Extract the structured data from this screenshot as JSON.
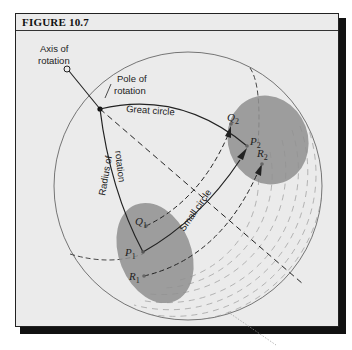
{
  "figure": {
    "title": "FIGURE 10.7",
    "colors": {
      "background": "#ebebeb",
      "frame": "#222222",
      "patch_fill": "#8f8f8f",
      "line": "#333333"
    }
  },
  "labels": {
    "axis_line1": "Axis of",
    "axis_line2": "rotation",
    "pole_line1": "Pole of",
    "pole_line2": "rotation",
    "great_circle": "Great circle",
    "radius_line1": "Radius of",
    "radius_line2": "rotation",
    "small_circle": "Small circle"
  },
  "points": {
    "P1": {
      "letter": "P",
      "sub": "1"
    },
    "Q1": {
      "letter": "Q",
      "sub": "1"
    },
    "R1": {
      "letter": "R",
      "sub": "1"
    },
    "P2": {
      "letter": "P",
      "sub": "2"
    },
    "Q2": {
      "letter": "Q",
      "sub": "2"
    },
    "R2": {
      "letter": "R",
      "sub": "2"
    }
  }
}
